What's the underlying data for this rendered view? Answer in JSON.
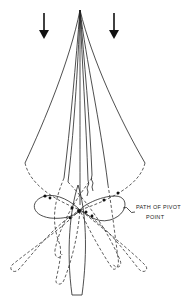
{
  "diagram": {
    "annotation": {
      "line1": "PATH OF PIVOT",
      "line2": "POINT"
    },
    "arrows": [
      {
        "name": "flow-arrow-left",
        "x": 44,
        "y1": 13,
        "y2": 38,
        "direction": "down"
      },
      {
        "name": "flow-arrow-right",
        "x": 114,
        "y1": 13,
        "y2": 38,
        "direction": "down"
      }
    ],
    "apex": {
      "x": 80,
      "y": 10
    },
    "pivot_point": {
      "x": 79,
      "y": 211
    },
    "colors": {
      "line": "#222222",
      "background": "#ffffff"
    }
  }
}
